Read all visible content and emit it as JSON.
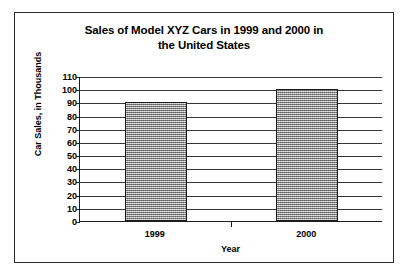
{
  "chart_data": {
    "type": "bar",
    "title": "Sales of Model XYZ Cars in 1999 and 2000 in the United States",
    "title_lines": [
      "Sales of Model XYZ Cars in 1999 and 2000 in",
      "the United States"
    ],
    "categories": [
      "1999",
      "2000"
    ],
    "values": [
      90,
      100
    ],
    "series": [
      {
        "name": "Car Sales",
        "values": [
          90,
          100
        ]
      }
    ],
    "xlabel": "Year",
    "ylabel": "Car Sales, in Thousands",
    "ylim": [
      0,
      110
    ],
    "ytick_step": 10,
    "yticks": [
      110,
      100,
      90,
      80,
      70,
      60,
      50,
      40,
      30,
      20,
      10,
      0
    ],
    "grid": true,
    "grid_axis": "y",
    "legend": false,
    "bar_fill_color": "#a8a8a8",
    "bar_border_color": "#1a1a1a",
    "axis_color": "#1d1d1d",
    "gridline_color": "#353535",
    "background_color": "#ffffff",
    "frame_color": "#2b2b2b"
  }
}
